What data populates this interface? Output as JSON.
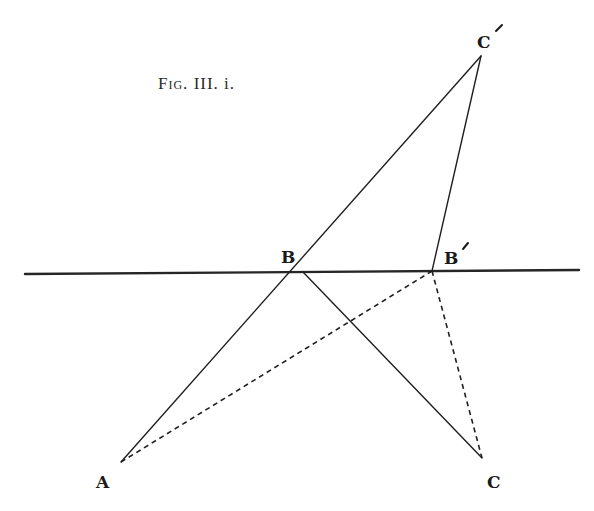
{
  "figure": {
    "caption": {
      "prefix": "Fig.",
      "number": "III. i."
    },
    "colors": {
      "background": "#ffffff",
      "ink": "#1f1f1f"
    },
    "points": {
      "A": {
        "label": "A",
        "x": 121,
        "y": 462
      },
      "B": {
        "label": "B",
        "x": 303,
        "y": 272
      },
      "B_prime": {
        "label": "B",
        "prime": "´",
        "x": 432,
        "y": 271
      },
      "C": {
        "label": "C",
        "x": 482,
        "y": 458
      },
      "C_prime": {
        "label": "C",
        "prime": "´",
        "x": 481,
        "y": 56
      }
    },
    "mirror_line": {
      "x1": 25,
      "y1": 274,
      "x2": 579,
      "y2": 270
    },
    "segments": {
      "solid": [
        {
          "from": "A",
          "to": "C_prime"
        },
        {
          "from": "B",
          "to": "C"
        },
        {
          "from": "B_prime",
          "to": "C_prime"
        }
      ],
      "dashed": [
        {
          "from": "A",
          "to": "B_prime"
        },
        {
          "from": "B_prime",
          "to": "C"
        }
      ]
    }
  }
}
